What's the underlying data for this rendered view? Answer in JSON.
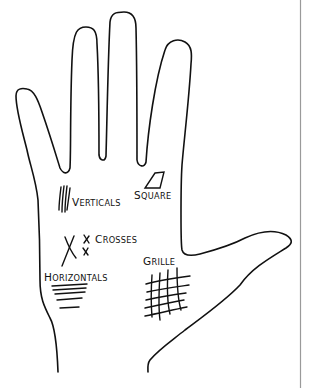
{
  "diagram": {
    "labels": {
      "verticals": {
        "cap": "V",
        "rest": "ERTICALS"
      },
      "square": {
        "cap": "S",
        "rest": "QUARE"
      },
      "crosses": {
        "cap": "C",
        "rest": "ROSSES"
      },
      "horizontals": {
        "cap": "H",
        "rest": "ORIZONTALS"
      },
      "grille": {
        "cap": "G",
        "rest": "RILLE"
      }
    }
  }
}
